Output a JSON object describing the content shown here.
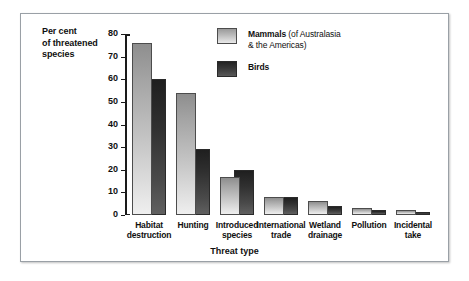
{
  "chart_data": {
    "type": "bar",
    "title": "",
    "xlabel": "Threat type",
    "ylabel": "Per cent of threatened species",
    "ylabel_lines": [
      "Per cent",
      "of threatened",
      "species"
    ],
    "ylim": [
      0,
      80
    ],
    "yticks": [
      0,
      10,
      20,
      30,
      40,
      50,
      60,
      70,
      80
    ],
    "grid": false,
    "legend_position": "top-right",
    "categories": [
      "Habitat destruction",
      "Hunting",
      "Introduced species",
      "International trade",
      "Wetland drainage",
      "Pollution",
      "Incidental take"
    ],
    "category_lines": [
      [
        "Habitat",
        "destruction"
      ],
      [
        "Hunting"
      ],
      [
        "Introduced",
        "species"
      ],
      [
        "International",
        "trade"
      ],
      [
        "Wetland",
        "drainage"
      ],
      [
        "Pollution"
      ],
      [
        "Incidental",
        "take"
      ]
    ],
    "series": [
      {
        "name": "Mammals",
        "note": "(of Australasia & the Americas)",
        "color": "#bcbcbc",
        "values": [
          76,
          54,
          17,
          8,
          6,
          3,
          2
        ]
      },
      {
        "name": "Birds",
        "note": "",
        "color": "#333333",
        "values": [
          60,
          29,
          20,
          8,
          4,
          2,
          1
        ]
      }
    ]
  },
  "legend": [
    {
      "label": "Mammals",
      "note": "(of Australasia",
      "note2": "& the Americas)"
    },
    {
      "label": "Birds",
      "note": "",
      "note2": ""
    }
  ]
}
